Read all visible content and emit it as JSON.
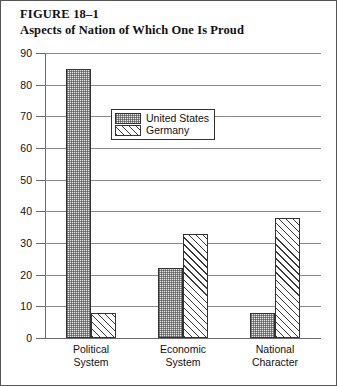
{
  "figure": {
    "number_label": "FIGURE 18–1",
    "title": "Aspects of Nation of Which One Is Proud"
  },
  "legend": {
    "items": [
      {
        "label": "United States",
        "pattern": "stipple",
        "swatch_name": "united-states"
      },
      {
        "label": "Germany",
        "pattern": "diagonal-hatch",
        "swatch_name": "germany"
      }
    ]
  },
  "axis": {
    "y_ticks": [
      "90",
      "80",
      "70",
      "60",
      "50",
      "40",
      "30",
      "20",
      "10",
      "0"
    ]
  },
  "groups": [
    {
      "label": "Political\nSystem"
    },
    {
      "label": "Economic\nSystem"
    },
    {
      "label": "National\nCharacter"
    }
  ],
  "chart_data": {
    "type": "bar",
    "title": "Aspects of Nation of Which One Is Proud",
    "xlabel": "",
    "ylabel": "",
    "ylim": [
      0,
      90
    ],
    "ytick_step": 10,
    "grid": true,
    "legend_position": "upper-center",
    "categories": [
      "Political System",
      "Economic System",
      "National Character"
    ],
    "series": [
      {
        "name": "United States",
        "values": [
          85,
          22,
          8
        ]
      },
      {
        "name": "Germany",
        "values": [
          8,
          33,
          38
        ]
      }
    ]
  },
  "colors": {
    "background": "#ffffff",
    "ink": "#111111",
    "gridline": "#8a8a8a",
    "bar_outline": "#333333",
    "us_fill": "#e4e4e4",
    "germany_fill": "#ffffff"
  }
}
